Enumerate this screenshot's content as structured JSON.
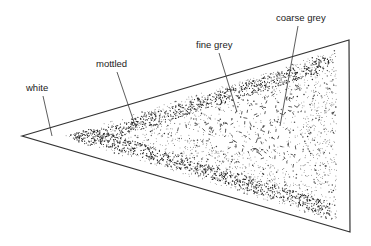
{
  "diagram": {
    "type": "annotated-triangle-texture-zones",
    "triangle": {
      "apex_left": [
        22,
        136
      ],
      "top_right": [
        349,
        40
      ],
      "bottom_right": [
        350,
        232
      ],
      "stroke": "#333333"
    },
    "labels": [
      {
        "id": "white",
        "text": "white",
        "x": 26,
        "y": 91,
        "line": [
          43,
          96,
          52,
          136
        ]
      },
      {
        "id": "mottled",
        "text": "mottled",
        "x": 96,
        "y": 67,
        "line": [
          117,
          72,
          136,
          128
        ]
      },
      {
        "id": "fine-grey",
        "text": "fine grey",
        "x": 196,
        "y": 48,
        "line": [
          219,
          53,
          237,
          112
        ]
      },
      {
        "id": "coarse-grey",
        "text": "coarse grey",
        "x": 276,
        "y": 21,
        "line": [
          298,
          26,
          280,
          126
        ]
      }
    ],
    "zones": [
      {
        "name": "white",
        "description": "blank border zone inside triangle"
      },
      {
        "name": "mottled",
        "description": "dense clustered stipple band"
      },
      {
        "name": "fine grey",
        "description": "uniform fine dot stipple"
      },
      {
        "name": "coarse grey",
        "description": "short dash marks in center"
      }
    ]
  }
}
